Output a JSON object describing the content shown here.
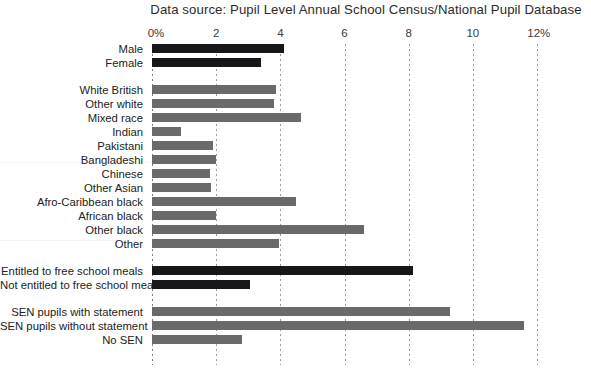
{
  "chart_data": {
    "type": "bar",
    "orientation": "horizontal",
    "title": "Data source: Pupil Level Annual School Census/National Pupil Database",
    "xlabel": "",
    "ylabel": "",
    "xlim": [
      0,
      12
    ],
    "xticks": [
      0,
      2,
      4,
      6,
      8,
      10,
      12
    ],
    "xtick_labels": [
      "0%",
      "2",
      "4",
      "6",
      "8",
      "10",
      "12%"
    ],
    "grid": true,
    "legend": null,
    "groups": [
      {
        "name": "gender",
        "color": "#17171a",
        "categories": [
          "Male",
          "Female"
        ],
        "values": [
          4.1,
          3.4
        ]
      },
      {
        "name": "ethnicity",
        "color": "#6a6a6a",
        "categories": [
          "White British",
          "Other white",
          "Mixed race",
          "Indian",
          "Pakistani",
          "Bangladeshi",
          "Chinese",
          "Other Asian",
          "Afro-Caribbean black",
          "African black",
          "Other black",
          "Other"
        ],
        "values": [
          3.85,
          3.8,
          4.65,
          0.9,
          1.9,
          2.0,
          1.8,
          1.85,
          4.5,
          2.0,
          6.6,
          3.95
        ]
      },
      {
        "name": "free-school-meals",
        "color": "#17171a",
        "categories": [
          "Entitled to free school meals",
          "Not entitled to free school meals"
        ],
        "values": [
          8.15,
          3.05
        ]
      },
      {
        "name": "special-educational-needs",
        "color": "#6a6a6a",
        "categories": [
          "SEN pupils with statement",
          "SEN pupils without statement",
          "No SEN"
        ],
        "values": [
          9.3,
          11.6,
          2.8
        ]
      }
    ],
    "categories": [
      "Male",
      "Female",
      "White British",
      "Other white",
      "Mixed race",
      "Indian",
      "Pakistani",
      "Bangladeshi",
      "Chinese",
      "Other Asian",
      "Afro-Caribbean black",
      "African black",
      "Other black",
      "Other",
      "Entitled to free school meals",
      "Not entitled to free school meals",
      "SEN pupils with statement",
      "SEN pupils without statement",
      "No SEN"
    ],
    "values": [
      4.1,
      3.4,
      3.85,
      3.8,
      4.65,
      0.9,
      1.9,
      2.0,
      1.8,
      1.85,
      4.5,
      2.0,
      6.6,
      3.95,
      8.15,
      3.05,
      9.3,
      11.6,
      2.8
    ],
    "colors": {
      "dark_bar": "#17171a",
      "gray_bar": "#6a6a6a",
      "gridline": "#9a9a9a",
      "background": "#ffffff",
      "text": "#222222"
    }
  }
}
